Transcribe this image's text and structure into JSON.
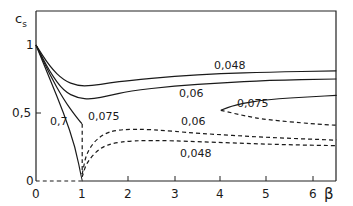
{
  "chart_data": {
    "type": "line",
    "title": "",
    "xlabel": "β",
    "ylabel": "c_s",
    "xlim": [
      0,
      6.5
    ],
    "ylim": [
      0,
      1.2
    ],
    "grid": false,
    "legend": "inline curve labels",
    "xticks": [
      "0",
      "1",
      "2",
      "3",
      "4",
      "5",
      "6"
    ],
    "yticks": [
      "0",
      "0,5",
      "1"
    ],
    "series": [
      {
        "name": "0.048",
        "style": "solid",
        "points": [
          [
            0,
            1
          ],
          [
            0.3,
            0.84
          ],
          [
            0.6,
            0.74
          ],
          [
            0.9,
            0.7
          ],
          [
            1.2,
            0.7
          ],
          [
            1.6,
            0.72
          ],
          [
            2,
            0.74
          ],
          [
            3,
            0.77
          ],
          [
            4,
            0.79
          ],
          [
            5,
            0.8
          ],
          [
            6.5,
            0.81
          ]
        ]
      },
      {
        "name": "0.06",
        "style": "solid",
        "points": [
          [
            0,
            1
          ],
          [
            0.3,
            0.8
          ],
          [
            0.6,
            0.66
          ],
          [
            0.9,
            0.61
          ],
          [
            1.2,
            0.6
          ],
          [
            1.6,
            0.63
          ],
          [
            2,
            0.66
          ],
          [
            3,
            0.7
          ],
          [
            4,
            0.72
          ],
          [
            5,
            0.74
          ],
          [
            6.5,
            0.75
          ]
        ]
      },
      {
        "name": "0.075",
        "style": "solid",
        "points": [
          [
            0,
            1
          ],
          [
            0.3,
            0.78
          ],
          [
            0.6,
            0.6
          ],
          [
            0.85,
            0.48
          ],
          [
            1,
            0.42
          ]
        ]
      },
      {
        "name": "0.7",
        "style": "solid",
        "points": [
          [
            0,
            1
          ],
          [
            0.3,
            0.75
          ],
          [
            0.6,
            0.5
          ],
          [
            0.85,
            0.25
          ],
          [
            1,
            0
          ]
        ]
      },
      {
        "name": "0.075 (upper branch)",
        "style": "solid",
        "points": [
          [
            4,
            0.52
          ],
          [
            4.3,
            0.56
          ],
          [
            5,
            0.6
          ],
          [
            6,
            0.62
          ],
          [
            6.5,
            0.63
          ]
        ]
      },
      {
        "name": "0.075 (lower branch)",
        "style": "dashed",
        "points": [
          [
            4,
            0.52
          ],
          [
            4.5,
            0.48
          ],
          [
            5,
            0.45
          ],
          [
            6,
            0.42
          ],
          [
            6.5,
            0.41
          ]
        ]
      },
      {
        "name": "0.075 (dashed, near β=1)",
        "style": "dashed",
        "points": [
          [
            1,
            0.42
          ],
          [
            1,
            0.2
          ],
          [
            1,
            0.05
          ]
        ]
      },
      {
        "name": "0.06 (dashed)",
        "style": "dashed",
        "points": [
          [
            1,
            0.05
          ],
          [
            1.1,
            0.22
          ],
          [
            1.4,
            0.34
          ],
          [
            1.8,
            0.38
          ],
          [
            2.5,
            0.38
          ],
          [
            3.5,
            0.35
          ],
          [
            5,
            0.32
          ],
          [
            6.5,
            0.3
          ]
        ]
      },
      {
        "name": "0.048 (dashed)",
        "style": "dashed",
        "points": [
          [
            1,
            0.03
          ],
          [
            1.1,
            0.14
          ],
          [
            1.4,
            0.25
          ],
          [
            1.8,
            0.29
          ],
          [
            2.5,
            0.3
          ],
          [
            3.5,
            0.29
          ],
          [
            5,
            0.27
          ],
          [
            6.5,
            0.26
          ]
        ]
      },
      {
        "name": "baseline (dashed)",
        "style": "dashed",
        "points": [
          [
            0,
            0
          ],
          [
            1,
            0
          ]
        ]
      }
    ],
    "annotations": [
      {
        "text": "0,048",
        "x": 4.1,
        "y": 0.85
      },
      {
        "text": "0,06",
        "x": 3.3,
        "y": 0.64
      },
      {
        "text": "0,075",
        "x": 4.4,
        "y": 0.56
      },
      {
        "text": "0,7",
        "x": 0.55,
        "y": 0.46
      },
      {
        "text": "0,075",
        "x": 1.05,
        "y": 0.47
      },
      {
        "text": "0,06",
        "x": 3.3,
        "y": 0.35
      },
      {
        "text": "0,048",
        "x": 3.3,
        "y": 0.17
      }
    ]
  },
  "labels": {
    "y_axis": "c",
    "y_axis_sub": "s",
    "x_axis": "β",
    "tick_x": [
      "0",
      "1",
      "2",
      "3",
      "4",
      "5",
      "6"
    ],
    "tick_y_0": "0",
    "tick_y_05": "0,5",
    "tick_y_1": "1",
    "ann_0048_top": "0,048",
    "ann_006_top": "0,06",
    "ann_0075_right": "0,075",
    "ann_07": "0,7",
    "ann_0075_left": "0,075",
    "ann_006_dash": "0,06",
    "ann_0048_dash": "0,048"
  }
}
